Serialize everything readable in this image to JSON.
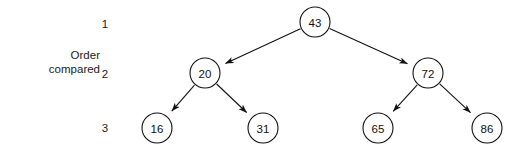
{
  "figure": {
    "caption_line1": "Order",
    "caption_line2": "compared",
    "background_color": "#ffffff",
    "stroke_color": "#111111",
    "node_fill_color": "#ffffff"
  },
  "levels": [
    {
      "label": "1",
      "x": 105,
      "y": 18
    },
    {
      "label": "2",
      "x": 105,
      "y": 68
    },
    {
      "label": "3",
      "x": 105,
      "y": 122
    }
  ],
  "nodes": [
    {
      "id": "n43",
      "value": "43",
      "cx": 315,
      "cy": 22,
      "r": 15,
      "level": 1
    },
    {
      "id": "n20",
      "value": "20",
      "cx": 205,
      "cy": 73,
      "r": 15,
      "level": 2
    },
    {
      "id": "n72",
      "value": "72",
      "cx": 428,
      "cy": 73,
      "r": 15,
      "level": 2
    },
    {
      "id": "n16",
      "value": "16",
      "cx": 157,
      "cy": 128,
      "r": 15,
      "level": 3
    },
    {
      "id": "n31",
      "value": "31",
      "cx": 263,
      "cy": 128,
      "r": 15,
      "level": 3
    },
    {
      "id": "n65",
      "value": "65",
      "cx": 378,
      "cy": 128,
      "r": 15,
      "level": 3
    },
    {
      "id": "n86",
      "value": "86",
      "cx": 487,
      "cy": 128,
      "r": 15,
      "level": 3
    }
  ],
  "edges": [
    {
      "from": "n43",
      "to": "n20",
      "arrow": true
    },
    {
      "from": "n43",
      "to": "n72",
      "arrow": true
    },
    {
      "from": "n20",
      "to": "n16",
      "arrow": true
    },
    {
      "from": "n20",
      "to": "n31",
      "arrow": true
    },
    {
      "from": "n72",
      "to": "n65",
      "arrow": true
    },
    {
      "from": "n72",
      "to": "n86",
      "arrow": true
    }
  ],
  "chart_data": {
    "type": "diagram",
    "title": "",
    "diagram_kind": "binary-search-tree",
    "root": "43",
    "tree": {
      "value": "43",
      "children": [
        {
          "value": "20",
          "children": [
            {
              "value": "16"
            },
            {
              "value": "31"
            }
          ]
        },
        {
          "value": "72",
          "children": [
            {
              "value": "65"
            },
            {
              "value": "86"
            }
          ]
        }
      ]
    },
    "level_labels": [
      "1",
      "2",
      "3"
    ],
    "level_axis_caption": "Order compared",
    "values_by_level": [
      [
        "43"
      ],
      [
        "20",
        "72"
      ],
      [
        "16",
        "31",
        "65",
        "86"
      ]
    ]
  }
}
